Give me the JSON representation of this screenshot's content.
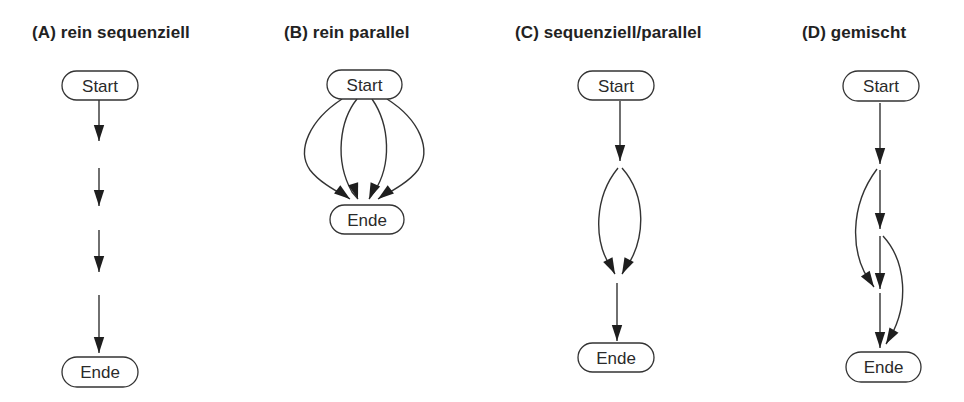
{
  "colors": {
    "background": "#ffffff",
    "stroke": "#333333",
    "text": "#222222"
  },
  "panels": [
    {
      "id": "A",
      "title": "(A) rein sequenziell",
      "title_x": 32,
      "nodes": [
        {
          "id": "start",
          "label": "Start",
          "x": 62,
          "y": 71,
          "w": 76,
          "h": 29
        },
        {
          "id": "end",
          "label": "Ende",
          "x": 62,
          "y": 357,
          "w": 76,
          "h": 30
        }
      ],
      "edges": [
        {
          "path": "M99,100 L99,141",
          "tip": [
            99,
            141
          ],
          "dir": [
            0,
            1
          ]
        },
        {
          "path": "M99,168 L99,206",
          "tip": [
            99,
            206
          ],
          "dir": [
            0,
            1
          ]
        },
        {
          "path": "M99,230 L99,272",
          "tip": [
            99,
            272
          ],
          "dir": [
            0,
            1
          ]
        },
        {
          "path": "M99,295 L99,353",
          "tip": [
            99,
            353
          ],
          "dir": [
            0,
            1
          ]
        }
      ]
    },
    {
      "id": "B",
      "title": "(B) rein parallel",
      "title_x": 284,
      "nodes": [
        {
          "id": "start",
          "label": "Start",
          "x": 327,
          "y": 70,
          "w": 75,
          "h": 29
        },
        {
          "id": "end",
          "label": "Ende",
          "x": 330,
          "y": 205,
          "w": 74,
          "h": 29
        }
      ],
      "edges": [
        {
          "path": "M342,99 C310,120 296,150 310,170 C320,183 338,192 350,199",
          "tip": [
            350,
            199
          ],
          "dir": [
            0.8,
            0.6
          ]
        },
        {
          "path": "M357,99 C340,120 334,160 352,192 L358,199",
          "tip": [
            358,
            199
          ],
          "dir": [
            0.3,
            0.95
          ]
        },
        {
          "path": "M372,99 C390,125 392,165 374,192 L369,199",
          "tip": [
            369,
            199
          ],
          "dir": [
            -0.4,
            0.92
          ]
        },
        {
          "path": "M387,99 C420,120 432,150 418,170 C408,183 390,192 378,199",
          "tip": [
            378,
            199
          ],
          "dir": [
            -0.8,
            0.6
          ]
        }
      ]
    },
    {
      "id": "C",
      "title": "(C) sequenziell/parallel",
      "title_x": 515,
      "nodes": [
        {
          "id": "start",
          "label": "Start",
          "x": 578,
          "y": 71,
          "w": 76,
          "h": 29
        },
        {
          "id": "end",
          "label": "Ende",
          "x": 578,
          "y": 343,
          "w": 76,
          "h": 29
        }
      ],
      "edges": [
        {
          "path": "M620,101 L620,161",
          "tip": [
            620,
            161
          ],
          "dir": [
            0,
            1
          ]
        },
        {
          "path": "M618,168 C596,195 590,240 615,274",
          "tip": [
            615,
            274
          ],
          "dir": [
            0.45,
            0.9
          ]
        },
        {
          "path": "M622,168 C646,195 648,240 622,274",
          "tip": [
            622,
            274
          ],
          "dir": [
            -0.45,
            0.9
          ]
        },
        {
          "path": "M617,283 L617,341",
          "tip": [
            617,
            341
          ],
          "dir": [
            0,
            1
          ]
        }
      ]
    },
    {
      "id": "D",
      "title": "(D) gemischt",
      "title_x": 802,
      "nodes": [
        {
          "id": "start",
          "label": "Start",
          "x": 843,
          "y": 71,
          "w": 76,
          "h": 30
        },
        {
          "id": "end",
          "label": "Ende",
          "x": 846,
          "y": 352,
          "w": 75,
          "h": 30
        }
      ],
      "edges": [
        {
          "path": "M880,103 L880,164",
          "tip": [
            880,
            164
          ],
          "dir": [
            0,
            1
          ]
        },
        {
          "path": "M880,170 L880,229",
          "tip": [
            880,
            229
          ],
          "dir": [
            0,
            1
          ]
        },
        {
          "path": "M877,169 C850,205 848,255 874,287",
          "tip": [
            874,
            287
          ],
          "dir": [
            0.55,
            0.85
          ]
        },
        {
          "path": "M880,236 L880,289",
          "tip": [
            880,
            289
          ],
          "dir": [
            0,
            1
          ]
        },
        {
          "path": "M880,293 L880,348",
          "tip": [
            880,
            348
          ],
          "dir": [
            0,
            1
          ]
        },
        {
          "path": "M883,236 C905,260 912,305 886,344",
          "tip": [
            886,
            344
          ],
          "dir": [
            -0.5,
            0.87
          ]
        }
      ]
    }
  ]
}
